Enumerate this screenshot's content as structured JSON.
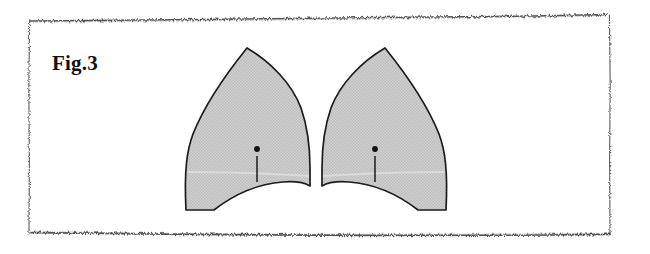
{
  "document": {
    "kind": "scanned-figure-page",
    "caption": "Fig.3",
    "background_color": "#ffffff",
    "border": {
      "style": "rough-scanned-rule",
      "color": "#3a3a3a",
      "left_x": 28,
      "right_x": 610,
      "top_y": 16,
      "bottom_y": 234
    }
  },
  "figure": {
    "label": "Fig.3",
    "fill_color": "#c9c9c9",
    "stroke_color": "#1c1c1c",
    "shading_band_color": "#d8d8d8",
    "marker_color": "#111111",
    "shapes": [
      {
        "name": "left-leaf",
        "apex": {
          "x": 247,
          "y": 48
        },
        "outer_corner": {
          "x": 186,
          "y": 210
        },
        "inner_corner": {
          "x": 310,
          "y": 186
        },
        "marker_dot": {
          "x": 257,
          "y": 148
        },
        "marker_tick_bottom": {
          "x": 257,
          "y": 170
        }
      },
      {
        "name": "right-leaf",
        "apex": {
          "x": 385,
          "y": 48
        },
        "outer_corner": {
          "x": 446,
          "y": 210
        },
        "inner_corner": {
          "x": 322,
          "y": 186
        },
        "marker_dot": {
          "x": 375,
          "y": 148
        },
        "marker_tick_bottom": {
          "x": 375,
          "y": 170
        }
      }
    ],
    "markers": [
      {
        "name": "left-leaf-marker",
        "type": "dot-with-tick"
      },
      {
        "name": "right-leaf-marker",
        "type": "dot-with-tick"
      }
    ]
  }
}
